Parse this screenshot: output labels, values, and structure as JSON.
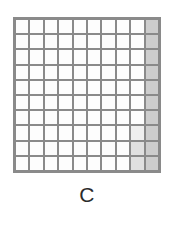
{
  "figure": {
    "caption": "C",
    "grid": {
      "rows": 10,
      "columns": 10,
      "line_color": "#8a8a8a",
      "cell_color": "#fdfdfd",
      "shaded_color": "#cdcdcd",
      "border_width_px": 3
    }
  },
  "chart_data": {
    "type": "heatmap",
    "title": "C",
    "xlabel": "",
    "ylabel": "",
    "grid": true,
    "legend": "none",
    "categories": [
      "1",
      "2",
      "3",
      "4",
      "5",
      "6",
      "7",
      "8",
      "9",
      "10"
    ],
    "row_labels": [
      "1",
      "2",
      "3",
      "4",
      "5",
      "6",
      "7",
      "8",
      "9",
      "10"
    ],
    "total_cells": 100,
    "shaded_cells": 10,
    "shaded_fraction": "10/100",
    "values": [
      [
        0,
        0,
        0,
        0,
        0,
        0,
        0,
        0,
        0,
        1
      ],
      [
        0,
        0,
        0,
        0,
        0,
        0,
        0,
        0,
        0,
        1
      ],
      [
        0,
        0,
        0,
        0,
        0,
        0,
        0,
        0,
        0,
        1
      ],
      [
        0,
        0,
        0,
        0,
        0,
        0,
        0,
        0,
        0,
        1
      ],
      [
        0,
        0,
        0,
        0,
        0,
        0,
        0,
        0,
        0,
        1
      ],
      [
        0,
        0,
        0,
        0,
        0,
        0,
        0,
        0,
        0,
        1
      ],
      [
        0,
        0,
        0,
        0,
        0,
        0,
        0,
        0,
        0,
        1
      ],
      [
        0,
        0,
        0,
        0,
        0,
        0,
        0,
        0,
        0.3,
        1
      ],
      [
        0,
        0,
        0,
        0,
        0,
        0,
        0,
        0,
        0.6,
        1
      ],
      [
        0,
        0,
        0,
        0,
        0,
        0,
        0,
        0,
        0.6,
        1
      ]
    ]
  }
}
